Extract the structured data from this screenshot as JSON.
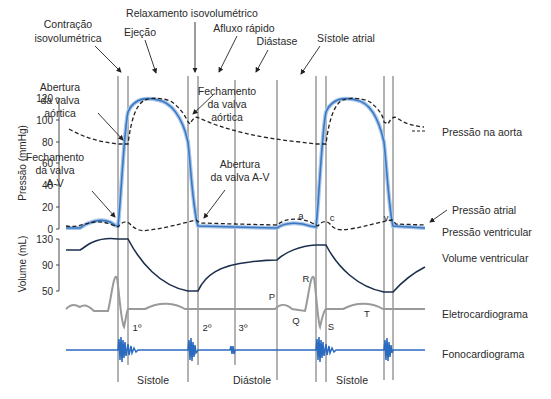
{
  "phase_labels": {
    "contracao": [
      "Contração",
      "isovolumétrica"
    ],
    "ejecao": "Ejeção",
    "relaxamento": "Relaxamento isovolumétrico",
    "afluxo": "Afluxo rápido",
    "diastase": "Diástase",
    "sistole_atrial": "Sístole atrial"
  },
  "annotations": {
    "abertura_aortica": [
      "Abertura",
      "da valva",
      "aórtica"
    ],
    "fechamento_aortica": [
      "Fechamento",
      "da valva",
      "aórtica"
    ],
    "fechamento_av": [
      "Fechamento",
      "da valva",
      "A-V"
    ],
    "abertura_av": [
      "Abertura",
      "da valva A-V"
    ],
    "wave_a": "a",
    "wave_c": "c",
    "wave_v": "v",
    "ecg_p": "P",
    "ecg_q": "Q",
    "ecg_r": "R",
    "ecg_s": "S",
    "ecg_t": "T",
    "sound_1": "1º",
    "sound_2": "2º",
    "sound_3": "3º"
  },
  "axes": {
    "pressure_title": "Pressão (mmHg)",
    "pressure_ticks": [
      "120",
      "100",
      "80",
      "60",
      "40",
      "20",
      "0"
    ],
    "volume_title": "Volume (mL)",
    "volume_ticks": [
      "130",
      "90",
      "50"
    ]
  },
  "trace_labels": {
    "aorta": "Pressão na aorta",
    "atrial": "Pressão atrial",
    "ventricular": "Pressão ventricular",
    "volume": "Volume ventricular",
    "ecg": "Eletrocardiograma",
    "phono": "Fonocardiograma"
  },
  "bottom_labels": {
    "sistole_1": "Sístole",
    "diastole": "Diástole",
    "sistole_2": "Sístole"
  },
  "colors": {
    "ventricular": "#3a78c2",
    "volume": "#1c2f4d",
    "ecg": "#9a9a9a",
    "phono": "#2a6ac0",
    "dashed": "#222222"
  }
}
